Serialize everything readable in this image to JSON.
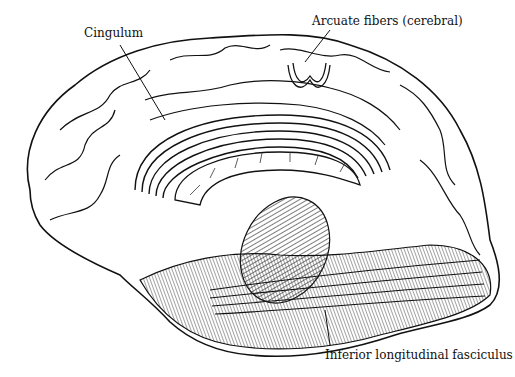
{
  "diagram": {
    "labels": {
      "cingulum": "Cingulum",
      "arcuate": "Arcuate fibers (cerebral)",
      "inferior_longitudinal": "Inferior longitudinal fasciculus"
    },
    "colors": {
      "ink": "#111111",
      "paper": "#ffffff",
      "shade": "#555555"
    }
  }
}
